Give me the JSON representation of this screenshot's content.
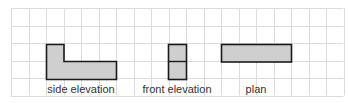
{
  "grid": {
    "left": 11,
    "top": 8,
    "cell": 17.5,
    "cols": 19,
    "rows": 5,
    "line_color": "#dcdcdc"
  },
  "shape_fill": "#cfcfcf",
  "shape_stroke": "#1a1a1a",
  "views": [
    {
      "name": "side elevation",
      "label": "side elevation",
      "label_x": 81
    },
    {
      "name": "front elevation",
      "label": "front elevation",
      "label_x": 177
    },
    {
      "name": "plan",
      "label": "plan",
      "label_x": 256
    }
  ]
}
